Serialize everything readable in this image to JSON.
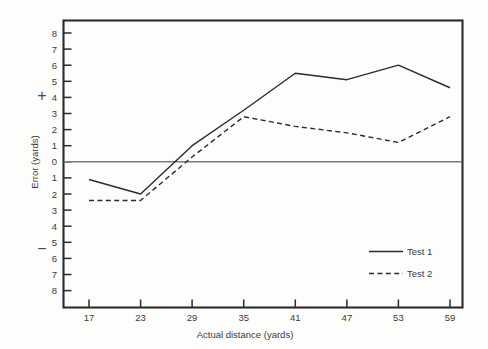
{
  "chart_data": {
    "type": "line",
    "title": "",
    "xlabel": "Actual distance (yards)",
    "ylabel": "Error (yards)",
    "x": [
      17,
      23,
      29,
      35,
      41,
      47,
      53,
      59
    ],
    "xticklabels": [
      "17",
      "23",
      "29",
      "35",
      "41",
      "47",
      "53",
      "59"
    ],
    "yticklabels": [
      "8",
      "7",
      "6",
      "5",
      "4",
      "3",
      "2",
      "1",
      "0",
      "1",
      "2",
      "3",
      "4",
      "5",
      "6",
      "7",
      "8"
    ],
    "ytickvalues": [
      8,
      7,
      6,
      5,
      4,
      3,
      2,
      1,
      0,
      -1,
      -2,
      -3,
      -4,
      -5,
      -6,
      -7,
      -8
    ],
    "ylim": [
      -8.6,
      8.6
    ],
    "xlim": [
      14.0,
      62.0
    ],
    "grid": false,
    "zero_line": true,
    "positive_symbol": "+",
    "negative_symbol": "−",
    "legend_position": "inside-lower-right",
    "series": [
      {
        "name": "Test 1",
        "style": "solid",
        "color": "#2b2b2b",
        "values": [
          -1.1,
          -2.0,
          1.0,
          3.2,
          5.5,
          5.1,
          6.0,
          4.6
        ]
      },
      {
        "name": "Test 2",
        "style": "dashed",
        "color": "#2b2b2b",
        "values": [
          -2.4,
          -2.4,
          0.3,
          2.8,
          2.2,
          1.8,
          1.2,
          2.8
        ]
      }
    ]
  },
  "legend": {
    "entries": [
      {
        "label": "Test 1"
      },
      {
        "label": "Test 2"
      }
    ]
  },
  "axes": {
    "y_axis_label": "Error (yards)",
    "x_axis_label": "Actual distance (yards)",
    "plus_sign": "+",
    "minus_sign": "−"
  }
}
